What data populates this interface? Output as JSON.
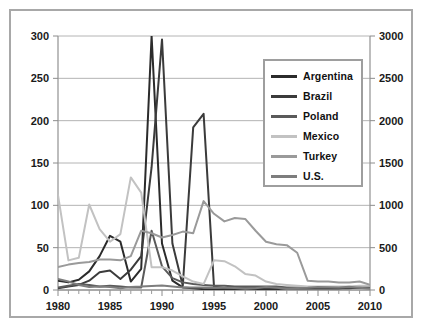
{
  "chart_data": {
    "type": "line",
    "title": "",
    "subtitle": "",
    "xlabel": "",
    "ylabel": "",
    "y2label": "",
    "xlim": [
      1980,
      2010
    ],
    "ylim": [
      0,
      300
    ],
    "y2lim": [
      0,
      3000
    ],
    "grid": true,
    "legend_position": "upper-right",
    "x_ticks_major": [
      "1980",
      "1985",
      "1990",
      "1995",
      "2000",
      "2005",
      "2010"
    ],
    "x_ticks_major_values": [
      1980,
      1985,
      1990,
      1995,
      2000,
      2005,
      2010
    ],
    "x_minor_tick_interval": 1,
    "y_ticks_left": [
      "0",
      "50",
      "100",
      "150",
      "200",
      "250",
      "300"
    ],
    "y_ticks_left_values": [
      0,
      50,
      100,
      150,
      200,
      250,
      300
    ],
    "y_ticks_right": [
      "0",
      "500",
      "1000",
      "1500",
      "2000",
      "2500",
      "3000"
    ],
    "y_ticks_right_values": [
      0,
      500,
      1000,
      1500,
      2000,
      2500,
      3000
    ],
    "x": [
      1980,
      1981,
      1982,
      1983,
      1984,
      1985,
      1986,
      1987,
      1988,
      1989,
      1990,
      1991,
      1992,
      1993,
      1994,
      1995,
      1996,
      1997,
      1998,
      1999,
      2000,
      2001,
      2002,
      2003,
      2004,
      2005,
      2006,
      2007,
      2008,
      2009,
      2010
    ],
    "series": [
      {
        "name": "Argentina",
        "color": "#2b2b2b",
        "axis": "left",
        "values": [
          11,
          9,
          12,
          22,
          40,
          64,
          57,
          10,
          25,
          300,
          55,
          11,
          3,
          2,
          1,
          1,
          1,
          1,
          1,
          1,
          1,
          1,
          2,
          2,
          2,
          2,
          2,
          2,
          3,
          3,
          3
        ]
      },
      {
        "name": "Brazil",
        "color": "#3b3b3b",
        "axis": "left",
        "values": [
          2,
          4,
          6,
          11,
          21,
          23,
          13,
          24,
          40,
          145,
          296,
          55,
          5,
          192,
          208,
          4,
          2,
          2,
          2,
          2,
          2,
          2,
          2,
          2,
          2,
          2,
          2,
          2,
          2,
          3,
          3
        ]
      },
      {
        "name": "Poland",
        "color": "#5a5a5a",
        "axis": "left",
        "values": [
          3,
          5,
          7,
          6,
          4,
          5,
          4,
          3,
          3,
          70,
          28,
          14,
          9,
          7,
          6,
          5,
          5,
          4,
          4,
          4,
          4,
          4,
          3,
          3,
          3,
          3,
          3,
          3,
          3,
          3,
          3
        ]
      },
      {
        "name": "Mexico",
        "color": "#c2c2c2",
        "axis": "left",
        "values": [
          112,
          35,
          38,
          101,
          72,
          57,
          66,
          133,
          115,
          27,
          27,
          23,
          16,
          10,
          7,
          35,
          34,
          28,
          19,
          17,
          10,
          7,
          6,
          5,
          4,
          4,
          4,
          4,
          4,
          5,
          5
        ]
      },
      {
        "name": "Turkey",
        "color": "#9a9a9a",
        "axis": "left",
        "values": [
          27,
          30,
          32,
          33,
          36,
          36,
          35,
          40,
          70,
          67,
          62,
          65,
          69,
          67,
          105,
          90,
          81,
          85,
          84,
          70,
          57,
          54,
          53,
          44,
          11,
          10,
          10,
          9,
          9,
          10,
          6
        ]
      },
      {
        "name": "U.S.",
        "color": "#7d7d7d",
        "axis": "right",
        "values": [
          130,
          100,
          60,
          35,
          40,
          35,
          20,
          35,
          40,
          48,
          54,
          42,
          30,
          30,
          30,
          28,
          28,
          23,
          15,
          22,
          34,
          28,
          16,
          23,
          27,
          34,
          32,
          29,
          38,
          27,
          16
        ]
      }
    ],
    "annotations": []
  },
  "legend": {
    "entries": [
      {
        "label": "Argentina",
        "color": "#2b2b2b"
      },
      {
        "label": "Brazil",
        "color": "#3b3b3b"
      },
      {
        "label": "Poland",
        "color": "#5a5a5a"
      },
      {
        "label": "Mexico",
        "color": "#c2c2c2"
      },
      {
        "label": "Turkey",
        "color": "#9a9a9a"
      },
      {
        "label": "U.S.",
        "color": "#7d7d7d"
      }
    ]
  },
  "colors": {
    "frame": "#a8a8a8",
    "grid": "#b4b4b4",
    "axis": "#9a9a9a",
    "text": "#1a1a1a",
    "background": "#ffffff"
  }
}
